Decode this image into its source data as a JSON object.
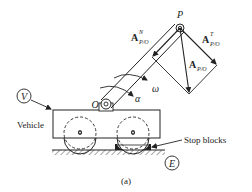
{
  "figure": {
    "caption": "(a)",
    "labels": {
      "point_p": "P",
      "point_o": "O",
      "omega": "ω",
      "alpha": "α",
      "vehicle": "Vehicle",
      "stop_blocks": "Stop blocks",
      "frame_v": "V",
      "frame_e": "E"
    },
    "vectors": {
      "normal": {
        "base": "A",
        "sup": "N",
        "sub": "P/O"
      },
      "tangential": {
        "base": "A",
        "sup": "T",
        "sub": "P/O"
      },
      "total": {
        "base": "A",
        "sub": "P/O"
      }
    },
    "colors": {
      "ink": "#222222",
      "background": "#ffffff"
    }
  }
}
